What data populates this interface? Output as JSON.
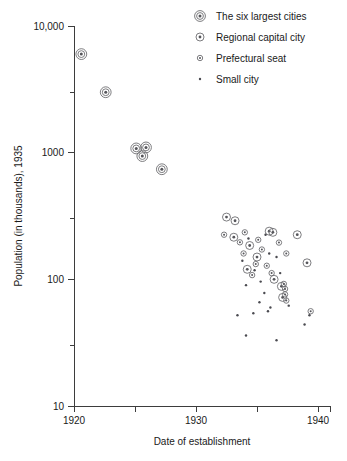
{
  "chart_data": {
    "type": "scatter",
    "title": "",
    "xlabel": "Date of establishment",
    "ylabel": "Population (in thousands), 1935",
    "xlim": [
      1920,
      1940
    ],
    "ylim": [
      10,
      10000
    ],
    "yscale": "log",
    "xscale": "linear",
    "grid": false,
    "legend_position": "top-right",
    "xticks": [
      1920,
      1925,
      1930,
      1935,
      1940
    ],
    "xtick_labels": [
      "1920",
      "",
      "1930",
      "",
      "1940"
    ],
    "yticks": [
      10,
      100,
      1000,
      10000
    ],
    "ytick_labels": [
      "10",
      "100",
      "1000",
      "10,000"
    ],
    "yminor_ticks": [
      30,
      300,
      3000
    ],
    "series": [
      {
        "name": "The six largest cities",
        "marker": "large-concentric-circle",
        "points": [
          {
            "x": 1920.6,
            "y": 6000
          },
          {
            "x": 1922.6,
            "y": 3000
          },
          {
            "x": 1925.1,
            "y": 1080
          },
          {
            "x": 1925.6,
            "y": 940
          },
          {
            "x": 1925.9,
            "y": 1100
          },
          {
            "x": 1927.2,
            "y": 740
          }
        ]
      },
      {
        "name": "Regional capital city",
        "marker": "medium-concentric-circle",
        "points": [
          {
            "x": 1932.5,
            "y": 310
          },
          {
            "x": 1933.2,
            "y": 290
          },
          {
            "x": 1933.1,
            "y": 215
          },
          {
            "x": 1934.4,
            "y": 185
          },
          {
            "x": 1936.0,
            "y": 240
          },
          {
            "x": 1936.3,
            "y": 235
          },
          {
            "x": 1935.0,
            "y": 150
          },
          {
            "x": 1934.2,
            "y": 120
          },
          {
            "x": 1936.4,
            "y": 100
          },
          {
            "x": 1937.0,
            "y": 88
          },
          {
            "x": 1937.1,
            "y": 72
          },
          {
            "x": 1938.3,
            "y": 225
          },
          {
            "x": 1939.1,
            "y": 135
          }
        ]
      },
      {
        "name": "Prefectural seat",
        "marker": "small-concentric-circle",
        "points": [
          {
            "x": 1934.0,
            "y": 235
          },
          {
            "x": 1933.6,
            "y": 196
          },
          {
            "x": 1936.8,
            "y": 195
          },
          {
            "x": 1935.4,
            "y": 172
          },
          {
            "x": 1935.1,
            "y": 205
          },
          {
            "x": 1934.9,
            "y": 132
          },
          {
            "x": 1935.8,
            "y": 128
          },
          {
            "x": 1933.9,
            "y": 160
          },
          {
            "x": 1937.4,
            "y": 160
          },
          {
            "x": 1934.6,
            "y": 108
          },
          {
            "x": 1936.2,
            "y": 112
          },
          {
            "x": 1937.2,
            "y": 92
          },
          {
            "x": 1937.3,
            "y": 84
          },
          {
            "x": 1937.3,
            "y": 76
          },
          {
            "x": 1937.4,
            "y": 68
          },
          {
            "x": 1932.3,
            "y": 225
          },
          {
            "x": 1939.4,
            "y": 56
          }
        ]
      },
      {
        "name": "Small city",
        "marker": "dot",
        "points": [
          {
            "x": 1934.3,
            "y": 210
          },
          {
            "x": 1935.7,
            "y": 225
          },
          {
            "x": 1936.6,
            "y": 150
          },
          {
            "x": 1933.8,
            "y": 140
          },
          {
            "x": 1934.8,
            "y": 118
          },
          {
            "x": 1935.3,
            "y": 96
          },
          {
            "x": 1936.0,
            "y": 160
          },
          {
            "x": 1934.1,
            "y": 90
          },
          {
            "x": 1935.6,
            "y": 78
          },
          {
            "x": 1935.2,
            "y": 66
          },
          {
            "x": 1936.1,
            "y": 60
          },
          {
            "x": 1935.9,
            "y": 56
          },
          {
            "x": 1934.7,
            "y": 54
          },
          {
            "x": 1933.4,
            "y": 52
          },
          {
            "x": 1939.3,
            "y": 52
          },
          {
            "x": 1934.1,
            "y": 36
          },
          {
            "x": 1936.6,
            "y": 33
          },
          {
            "x": 1937.6,
            "y": 62
          },
          {
            "x": 1938.9,
            "y": 44
          },
          {
            "x": 1936.9,
            "y": 112
          }
        ]
      }
    ]
  },
  "legend": {
    "items": [
      {
        "label": "The six largest cities",
        "marker": "large-concentric-circle"
      },
      {
        "label": "Regional capital city",
        "marker": "medium-concentric-circle"
      },
      {
        "label": "Prefectural seat",
        "marker": "small-concentric-circle"
      },
      {
        "label": "Small city",
        "marker": "dot"
      }
    ]
  }
}
